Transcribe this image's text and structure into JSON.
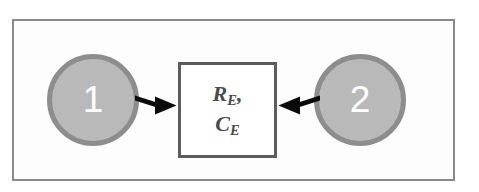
{
  "figure": {
    "frame": {
      "border_color": "#8a8a8a",
      "background_color": "#fdfdfd"
    },
    "nodes": [
      {
        "id": "node-1",
        "label": "1",
        "fill_color": "#b9b9b9",
        "border_color": "#8d8d8d",
        "label_color": "#ffffff"
      },
      {
        "id": "node-2",
        "label": "2",
        "fill_color": "#b9b9b9",
        "border_color": "#8d8d8d",
        "label_color": "#ffffff"
      }
    ],
    "element_box": {
      "line1_symbol": "R",
      "line1_subscript": "E",
      "line1_suffix": ",",
      "line2_symbol": "C",
      "line2_subscript": "E",
      "border_color": "#5c5c5c",
      "fill_color": "#ffffff",
      "text_color": "#4a4a4a"
    },
    "arrows": [
      {
        "id": "arrow-node1-to-box",
        "direction": "right",
        "from": "node-1",
        "to": "element-box",
        "color": "#000000"
      },
      {
        "id": "arrow-node2-to-box",
        "direction": "left",
        "from": "node-2",
        "to": "element-box",
        "color": "#000000"
      }
    ]
  }
}
